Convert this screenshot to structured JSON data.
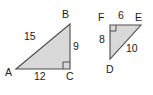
{
  "figure": {
    "background_color": "#ffffff",
    "fill_color": "#d9d9d9",
    "stroke_color": "#4d4d4d",
    "text_color": "#1a1a1a",
    "triangles": [
      {
        "name": "triangle-abc",
        "vertices": [
          {
            "label": "A",
            "x": 16,
            "y": 69
          },
          {
            "label": "B",
            "x": 70,
            "y": 24
          },
          {
            "label": "C",
            "x": 70,
            "y": 69
          }
        ],
        "right_angle_at": "C",
        "sides": [
          {
            "label": "15",
            "between": "AB"
          },
          {
            "label": "9",
            "between": "BC"
          },
          {
            "label": "12",
            "between": "AC"
          }
        ]
      },
      {
        "name": "triangle-def",
        "vertices": [
          {
            "label": "F",
            "x": 110,
            "y": 25
          },
          {
            "label": "E",
            "x": 141,
            "y": 25
          },
          {
            "label": "D",
            "x": 110,
            "y": 59
          }
        ],
        "right_angle_at": "F",
        "sides": [
          {
            "label": "6",
            "between": "FE"
          },
          {
            "label": "8",
            "between": "FD"
          },
          {
            "label": "10",
            "between": "DE"
          }
        ]
      }
    ],
    "labels": {
      "a": "A",
      "b": "B",
      "c": "C",
      "d": "D",
      "e": "E",
      "f": "F",
      "fifteen": "15",
      "nine": "9",
      "twelve": "12",
      "six": "6",
      "eight": "8",
      "ten": "10"
    }
  }
}
